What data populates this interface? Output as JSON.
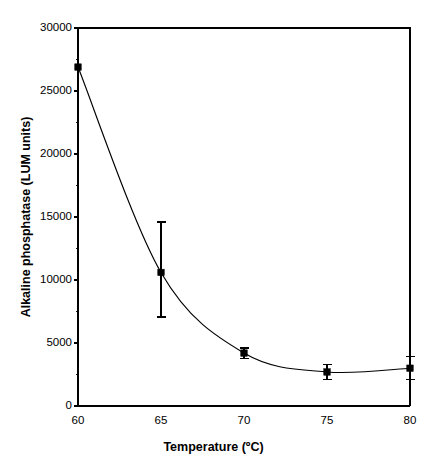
{
  "chart_data": {
    "type": "line",
    "title": "",
    "xlabel": "Temperature (ºC)",
    "ylabel": "Alkaline phosphatase (LUM units)",
    "xlim": [
      60,
      80
    ],
    "ylim": [
      0,
      30000
    ],
    "grid": false,
    "legend": "none",
    "marker": "filled-square",
    "x": [
      60,
      65,
      70,
      75,
      80
    ],
    "values": [
      26900,
      10600,
      4200,
      2700,
      3000
    ],
    "error_upper": [
      0,
      4000,
      400,
      600,
      900
    ],
    "error_lower": [
      0,
      3540,
      400,
      600,
      900
    ],
    "xticks": [
      60,
      65,
      70,
      75,
      80
    ],
    "xticklabels": [
      "60",
      "65",
      "70",
      "75",
      "80"
    ],
    "yticks": [
      0,
      5000,
      10000,
      15000,
      20000,
      25000,
      30000
    ],
    "yticklabels": [
      "0",
      "5000",
      "10000",
      "15000",
      "20000",
      "25000",
      "30000"
    ],
    "yminorticks": [
      2500,
      7500,
      12500,
      17500,
      22500,
      27500
    ],
    "series": [
      {
        "name": "Alkaline phosphatase",
        "points": [
          {
            "x": 60,
            "y": 26900,
            "err_up": 0,
            "err_dn": 0
          },
          {
            "x": 65,
            "y": 10600,
            "err_up": 4000,
            "err_dn": 3540
          },
          {
            "x": 70,
            "y": 4200,
            "err_up": 400,
            "err_dn": 400
          },
          {
            "x": 75,
            "y": 2700,
            "err_up": 600,
            "err_dn": 600
          },
          {
            "x": 80,
            "y": 3000,
            "err_up": 900,
            "err_dn": 900
          }
        ]
      }
    ],
    "colors": {
      "line": "#000000",
      "marker": "#000000",
      "axis": "#000000",
      "background": "#ffffff"
    }
  }
}
